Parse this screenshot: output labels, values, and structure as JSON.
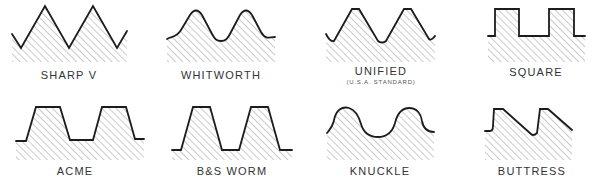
{
  "thread_forms": [
    {
      "id": "sharp-v",
      "label": "SHARP V",
      "sublabel": null
    },
    {
      "id": "whitworth",
      "label": "WHITWORTH",
      "sublabel": null
    },
    {
      "id": "unified",
      "label": "UNIFIED",
      "sublabel": "(U.S.A. STANDARD)"
    },
    {
      "id": "square",
      "label": "SQUARE",
      "sublabel": null
    },
    {
      "id": "acme",
      "label": "ACME",
      "sublabel": null
    },
    {
      "id": "bs-worm",
      "label": "B&S WORM",
      "sublabel": null
    },
    {
      "id": "knuckle",
      "label": "KNUCKLE",
      "sublabel": null
    },
    {
      "id": "buttress",
      "label": "BUTTRESS",
      "sublabel": null
    }
  ],
  "colors": {
    "outline": "#1c1c1c",
    "hatch": "#6a6a6a",
    "background": "#ffffff"
  }
}
